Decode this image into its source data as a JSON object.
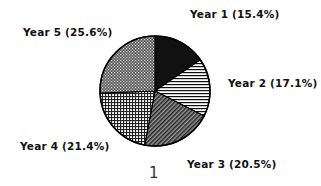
{
  "chart_data": {
    "type": "pie",
    "title": "",
    "categories": [
      "Year 1",
      "Year 2",
      "Year 3",
      "Year 4",
      "Year 5"
    ],
    "values": [
      15.4,
      17.1,
      20.5,
      21.4,
      25.6
    ],
    "unit": "%",
    "start_angle_deg": 90,
    "direction": "clockwise",
    "legend": "none (labels placed beside slices)",
    "labels": [
      "Year 1 (15.4%)",
      "Year 2 (17.1%)",
      "Year 3 (20.5%)",
      "Year 4 (21.4%)",
      "Year 5 (25.6%)"
    ],
    "patterns": [
      "solid-black",
      "horizontal-lines",
      "diagonal-hatch",
      "grid-crosshatch",
      "checker-dots"
    ]
  },
  "labels": {
    "year1": "Year 1 (15.4%)",
    "year2": "Year 2 (17.1%)",
    "year3": "Year 3 (20.5%)",
    "year4": "Year 4 (21.4%)",
    "year5": "Year 5 (25.6%)"
  },
  "page_number": "1"
}
